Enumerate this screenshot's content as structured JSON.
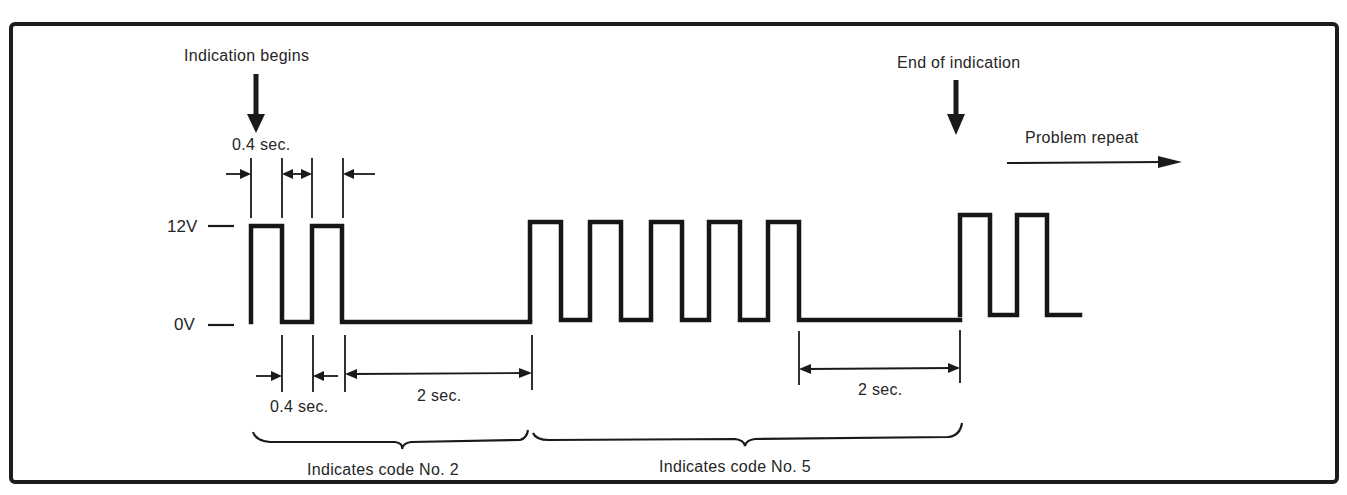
{
  "diagram": {
    "labels": {
      "indication_begins": "Indication begins",
      "end_of_indication": "End of indication",
      "problem_repeat": "Problem repeat",
      "top_pulse_width": "0.4 sec.",
      "bottom_gap_width": "0.4 sec.",
      "pause_1": "2 sec.",
      "pause_2": "2 sec.",
      "code_2": "Indicates code No. 2",
      "code_5": "Indicates code No. 5",
      "v_high": "12V",
      "v_low": "0V"
    },
    "voltage_levels": {
      "high": "12V",
      "low": "0V"
    },
    "timing": {
      "pulse_on": "0.4 sec.",
      "pulse_off": "0.4 sec.",
      "pause_between_codes": "2 sec."
    },
    "codes": [
      {
        "code": 2,
        "pulses": 2,
        "label": "Indicates code No. 2"
      },
      {
        "code": 5,
        "pulses": 5,
        "label": "Indicates code No. 5"
      }
    ],
    "colors": {
      "line": "#161616",
      "background": "#ffffff"
    }
  },
  "geometry": {
    "groups": [
      {
        "name": "code-2-pulses",
        "high_y": 226,
        "low_y": 322,
        "start_x": 251,
        "pulses": [
          [
            251,
            282
          ],
          [
            312,
            342
          ]
        ],
        "end_x": 530
      },
      {
        "name": "code-5-pulses",
        "high_y": 222,
        "low_y": 320,
        "start_x": 530,
        "pulses": [
          [
            530,
            561
          ],
          [
            590,
            621
          ],
          [
            651,
            682
          ],
          [
            709,
            740
          ],
          [
            768,
            799
          ]
        ],
        "end_x": 960
      },
      {
        "name": "repeat-pulses",
        "high_y": 215,
        "low_y": 315,
        "start_x": 960,
        "pulses": [
          [
            960,
            990
          ],
          [
            1017,
            1047
          ]
        ],
        "end_x": 1080
      }
    ]
  }
}
